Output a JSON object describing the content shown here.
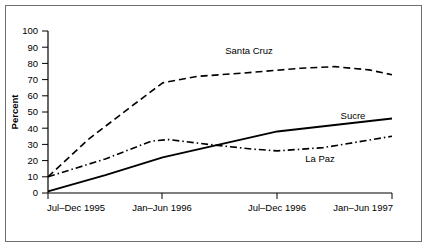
{
  "chart_data": {
    "type": "line",
    "title": "",
    "subtitle": "",
    "xlabel": "",
    "ylabel": "Percent",
    "ylim": [
      0,
      100
    ],
    "ytick_step": 10,
    "grid": false,
    "legend": "inline-labels",
    "categories": [
      "Jul–Dec 1995",
      "Jan–Jun 1996",
      "Jul–Dec 1996",
      "Jan–Jun 1997"
    ],
    "yticks": [
      "0",
      "10",
      "20",
      "30",
      "40",
      "50",
      "60",
      "70",
      "80",
      "90",
      "100"
    ],
    "series": [
      {
        "name": "Santa Cruz",
        "style": "dashed",
        "color": "#000000",
        "values": [
          10,
          68,
          76,
          73
        ],
        "points": [
          {
            "x": 0.0,
            "y": 10
          },
          {
            "x": 0.35,
            "y": 33
          },
          {
            "x": 0.7,
            "y": 52
          },
          {
            "x": 1.0,
            "y": 68
          },
          {
            "x": 1.3,
            "y": 72
          },
          {
            "x": 1.7,
            "y": 74
          },
          {
            "x": 2.2,
            "y": 77
          },
          {
            "x": 2.5,
            "y": 78
          },
          {
            "x": 2.8,
            "y": 76
          },
          {
            "x": 3.0,
            "y": 73
          }
        ]
      },
      {
        "name": "Sucre",
        "style": "solid",
        "color": "#000000",
        "values": [
          1,
          22,
          38,
          46
        ],
        "points": [
          {
            "x": 0.0,
            "y": 1
          },
          {
            "x": 0.5,
            "y": 11
          },
          {
            "x": 1.0,
            "y": 22
          },
          {
            "x": 1.5,
            "y": 30
          },
          {
            "x": 2.0,
            "y": 38
          },
          {
            "x": 2.5,
            "y": 42
          },
          {
            "x": 3.0,
            "y": 46
          }
        ]
      },
      {
        "name": "La Paz",
        "style": "dashdot",
        "color": "#000000",
        "values": [
          10,
          33,
          26,
          35
        ],
        "points": [
          {
            "x": 0.0,
            "y": 10
          },
          {
            "x": 0.5,
            "y": 21
          },
          {
            "x": 0.9,
            "y": 32
          },
          {
            "x": 1.05,
            "y": 33
          },
          {
            "x": 1.4,
            "y": 30
          },
          {
            "x": 1.8,
            "y": 27
          },
          {
            "x": 2.0,
            "y": 26
          },
          {
            "x": 2.4,
            "y": 28
          },
          {
            "x": 3.0,
            "y": 35
          }
        ]
      }
    ],
    "annotations": [
      {
        "text": "Santa Cruz",
        "x": 1.75,
        "y": 86
      },
      {
        "text": "Sucre",
        "x": 2.72,
        "y": 55
      },
      {
        "text": "La Paz",
        "x": 2.62,
        "y": 19
      }
    ]
  }
}
